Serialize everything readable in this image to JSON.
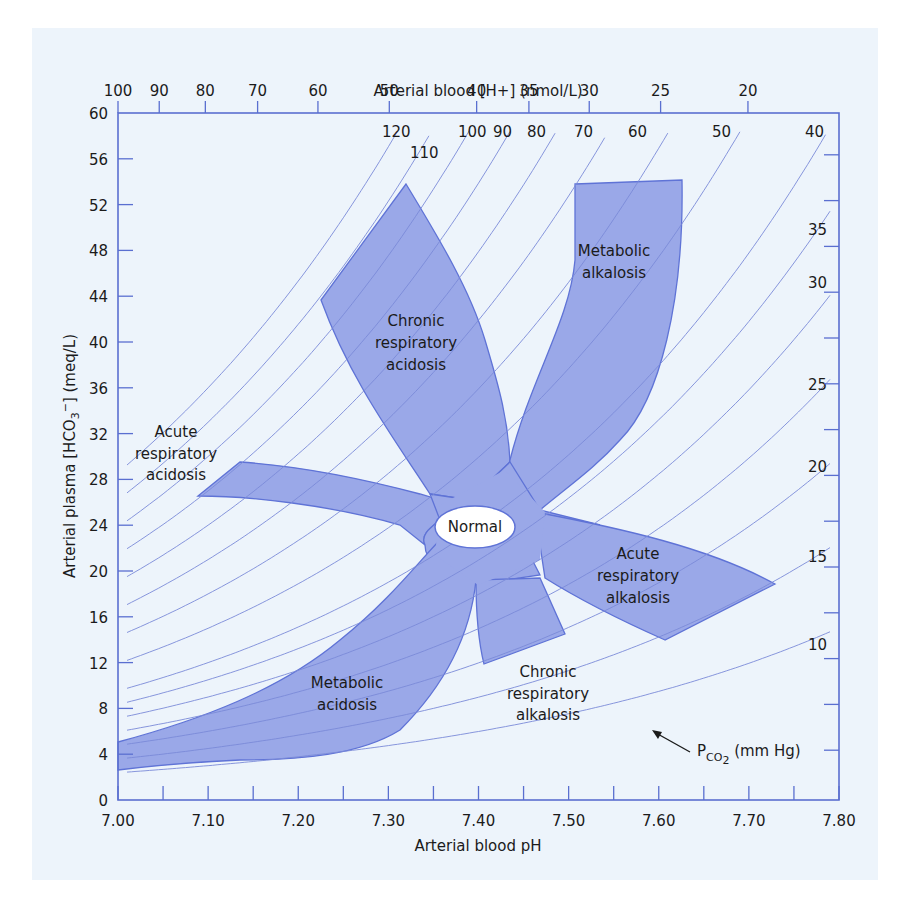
{
  "chart_data": {
    "type": "area",
    "xlabel": "Arterial blood pH",
    "ylabel": "Arterial plasma [HCO3-] (meq/L)",
    "top_xlabel": "Arterial blood [H+] (nmol/L)",
    "xlim": [
      7.0,
      7.8
    ],
    "ylim": [
      0,
      60
    ],
    "x_ticks": [
      "7.00",
      "7.10",
      "7.20",
      "7.30",
      "7.40",
      "7.50",
      "7.60",
      "7.70",
      "7.80"
    ],
    "y_ticks": [
      "0",
      "4",
      "8",
      "12",
      "16",
      "20",
      "24",
      "28",
      "32",
      "36",
      "40",
      "44",
      "48",
      "52",
      "56",
      "60"
    ],
    "top_ticks": [
      "100",
      "90",
      "80",
      "70",
      "60",
      "50",
      "40",
      "35",
      "30",
      "25",
      "20"
    ],
    "isopleth_label": "PCO2 (mm Hg)",
    "pco2_isopleths": [
      120,
      110,
      100,
      90,
      80,
      70,
      60,
      50,
      40,
      35,
      30,
      25,
      20,
      15,
      10
    ],
    "grid": false,
    "regions": [
      {
        "name": "Normal",
        "shape": "ellipse",
        "center": {
          "ph": 7.4,
          "hco3": 24
        }
      },
      {
        "name": "Chronic respiratory acidosis",
        "ph_range": [
          7.22,
          7.44
        ],
        "hco3_range": [
          26,
          54
        ]
      },
      {
        "name": "Metabolic alkalosis",
        "ph_range": [
          7.43,
          7.63
        ],
        "hco3_range": [
          25,
          54
        ]
      },
      {
        "name": "Acute respiratory acidosis",
        "ph_range": [
          7.09,
          7.38
        ],
        "hco3_range": [
          23,
          29.5
        ]
      },
      {
        "name": "Acute respiratory alkalosis",
        "ph_range": [
          7.45,
          7.73
        ],
        "hco3_range": [
          13.5,
          25
        ]
      },
      {
        "name": "Chronic respiratory alkalosis",
        "ph_range": [
          7.4,
          7.5
        ],
        "hco3_range": [
          12,
          19
        ]
      },
      {
        "name": "Metabolic acidosis",
        "ph_range": [
          7.0,
          7.42
        ],
        "hco3_range": [
          2.5,
          22
        ]
      }
    ]
  },
  "labels": {
    "top_axis_title": "Arterial blood [H+] (nmol/L)",
    "bottom_axis_title": "Arterial blood pH",
    "left_axis_title": "Arterial plasma [HCO3-] (meq/L)",
    "normal": "Normal",
    "chronic_resp_acidosis": [
      "Chronic",
      "respiratory",
      "acidosis"
    ],
    "metabolic_alkalosis": [
      "Metabolic",
      "alkalosis"
    ],
    "acute_resp_acidosis": [
      "Acute",
      "respiratory",
      "acidosis"
    ],
    "acute_resp_alkalosis": [
      "Acute",
      "respiratory",
      "alkalosis"
    ],
    "chronic_resp_alkalosis": [
      "Chronic",
      "respiratory",
      "alkalosis"
    ],
    "metabolic_acidosis": [
      "Metabolic",
      "acidosis"
    ],
    "pco2_label": "PCO2 (mm Hg)"
  },
  "colors": {
    "panel_bg": "#edf4fb",
    "axis": "#5a6fd0",
    "region_fill": "#9aa8e8",
    "region_stroke": "#5f73d6",
    "isopleth": "#7b8ad8",
    "text": "#1b1b1b"
  }
}
